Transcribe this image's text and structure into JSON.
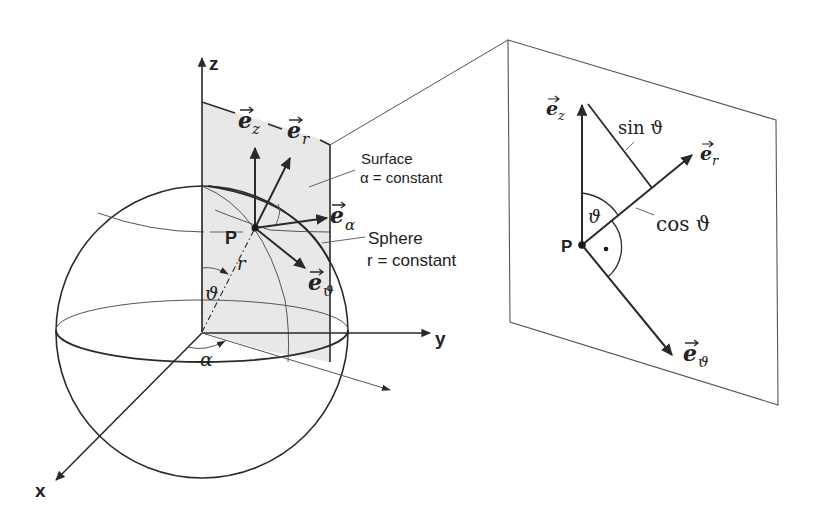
{
  "figure": {
    "colors": {
      "line": "#2a2a2a",
      "thin_line": "#555555",
      "surface_fill": "#e8e8e8",
      "background": "#ffffff"
    }
  },
  "left_view": {
    "axes": {
      "x_label": "x",
      "y_label": "y",
      "z_label": "z"
    },
    "point_label": "P",
    "radius_label": "r",
    "theta_label": "ϑ",
    "alpha_label": "α",
    "vectors": {
      "e_z": {
        "base": "e",
        "sub": "z"
      },
      "e_r": {
        "base": "e",
        "sub": "r"
      },
      "e_alpha": {
        "base": "e",
        "sub": "α"
      },
      "e_theta": {
        "base": "e",
        "sub": "ϑ"
      }
    },
    "annotations": {
      "surface_title": "Surface",
      "surface_condition": "α = constant",
      "sphere_title": "Sphere",
      "sphere_condition": "r = constant"
    }
  },
  "right_view": {
    "point_label": "P",
    "theta_label": "ϑ",
    "sin_label": "sin ϑ",
    "cos_label": "cos ϑ",
    "right_angle_marker": "•",
    "vectors": {
      "e_z": {
        "base": "e",
        "sub": "z"
      },
      "e_r": {
        "base": "e",
        "sub": "r"
      },
      "e_theta": {
        "base": "e",
        "sub": "ϑ"
      }
    }
  }
}
